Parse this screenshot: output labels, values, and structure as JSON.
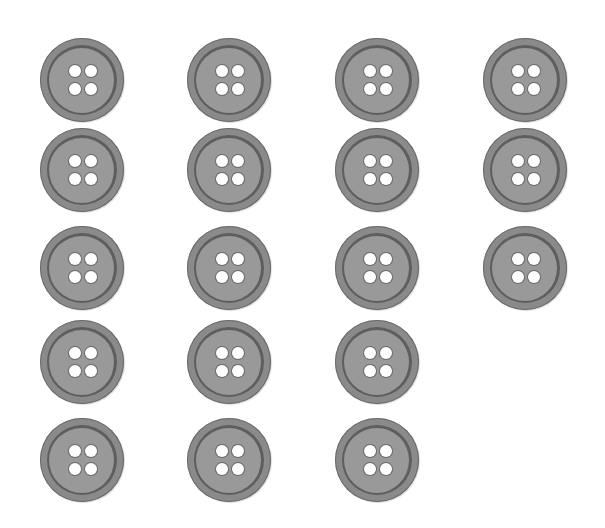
{
  "scene": {
    "description": "Grid of gray four-hole sewing buttons on white background",
    "total_count": 18,
    "rows": [
      {
        "row": 1,
        "count": 4
      },
      {
        "row": 2,
        "count": 4
      },
      {
        "row": 3,
        "count": 4
      },
      {
        "row": 4,
        "count": 3
      },
      {
        "row": 5,
        "count": 3
      }
    ],
    "colors": {
      "background": "#ffffff",
      "button_fill": "#999999",
      "button_rim": "#5e5e5e",
      "hole": "#ffffff"
    }
  }
}
